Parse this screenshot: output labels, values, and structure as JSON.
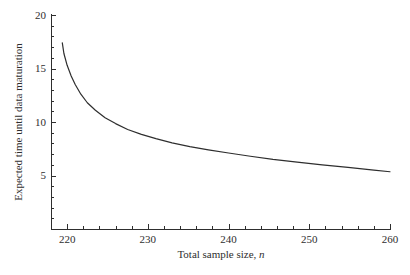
{
  "figure": {
    "background": "#ffffff",
    "ink_color": "#2e2e2e"
  },
  "chart_data": {
    "type": "line",
    "title": "",
    "xlabel_prefix": "Total sample size, ",
    "xlabel_var": "n",
    "ylabel": "Expected time until data maturation",
    "xlim": [
      218,
      260
    ],
    "ylim": [
      0,
      20
    ],
    "x_major_ticks": [
      220,
      230,
      240,
      250,
      260
    ],
    "x_minor_step": 2,
    "y_major_ticks": [
      5,
      10,
      15,
      20
    ],
    "y_minor_step": 1,
    "grid": false,
    "legend": null,
    "series": [
      {
        "name": "expected-time-curve",
        "color": "#2e2e2e",
        "x": [
          219.4,
          219.6,
          220.0,
          220.5,
          221.0,
          221.7,
          222.5,
          223.5,
          224.7,
          226.0,
          227.5,
          229.2,
          231.0,
          233.0,
          235.2,
          237.5,
          240.0,
          242.7,
          245.5,
          248.5,
          251.6,
          254.8,
          258.0,
          260.0
        ],
        "y": [
          17.4,
          16.4,
          15.3,
          14.3,
          13.5,
          12.6,
          11.8,
          11.1,
          10.4,
          9.85,
          9.3,
          8.85,
          8.45,
          8.05,
          7.7,
          7.4,
          7.1,
          6.8,
          6.5,
          6.25,
          6.0,
          5.75,
          5.5,
          5.35
        ]
      }
    ]
  }
}
